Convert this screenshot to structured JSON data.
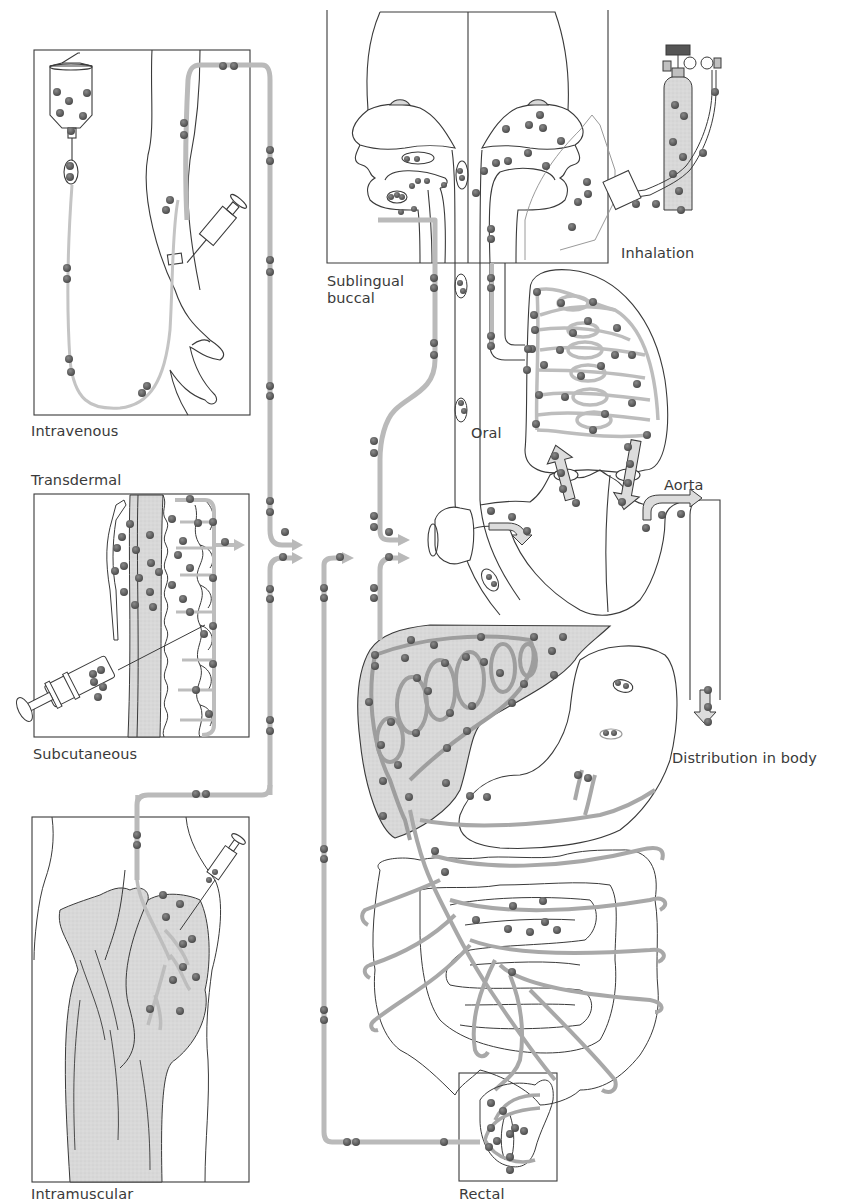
{
  "diagram": {
    "labels": {
      "intravenous": "Intravenous",
      "transdermal": "Transdermal",
      "subcutaneous": "Subcutaneous",
      "intramuscular": "Intramuscular",
      "sublingual": "Sublingual\nbuccal",
      "inhalation": "Inhalation",
      "oral": "Oral",
      "aorta": "Aorta",
      "distribution": "Distribution in body",
      "rectal": "Rectal"
    },
    "colors": {
      "line": "#3a3a3a",
      "pipe": "#b9b9b9",
      "pipe_dark": "#9a9a9a",
      "dot": "#5b5b5b",
      "tissue_fill": "#d9d9d9",
      "background": "#ffffff"
    },
    "panels": [
      {
        "name": "intravenous",
        "box": [
          34,
          50,
          216,
          365
        ]
      },
      {
        "name": "transdermal-subcutaneous",
        "box": [
          34,
          494,
          215,
          243
        ]
      },
      {
        "name": "intramuscular",
        "box": [
          32,
          817,
          217,
          365
        ]
      },
      {
        "name": "sublingual-buccal-head",
        "box": [
          327,
          0,
          281,
          263
        ]
      },
      {
        "name": "rectal",
        "box": [
          459,
          1073,
          98,
          108
        ]
      }
    ]
  }
}
